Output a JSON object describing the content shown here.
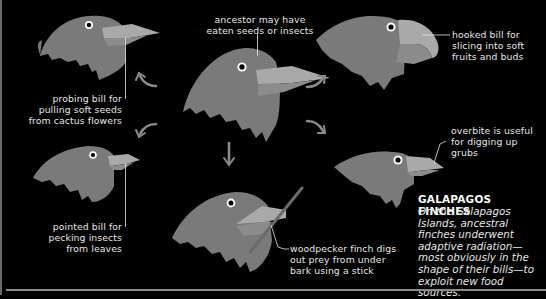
{
  "colors": {
    "background": "#000000",
    "bird_body": "#7a7a7a",
    "bird_head_shade": "#8a8a8a",
    "beak_upper": "#a9a9a9",
    "beak_lower": "#8c8c8c",
    "arrow": "#8a8a8a",
    "text": "#e6e6e6",
    "rule": "#8c8c8c"
  },
  "finches": [
    {
      "id": "ancestor",
      "caption": [
        "ancestor may have",
        "eaten seeds or insects"
      ]
    },
    {
      "id": "probing",
      "caption": [
        "probing bill for",
        "pulling soft seeds",
        "from cactus flowers"
      ]
    },
    {
      "id": "hooked",
      "caption": [
        "hooked bill for",
        "slicing into soft",
        "fruits and buds"
      ]
    },
    {
      "id": "pointed",
      "caption": [
        "pointed bill for",
        "pecking insects",
        "from leaves"
      ]
    },
    {
      "id": "woodpecker",
      "caption": [
        "woodpecker finch digs",
        "out prey from under",
        "bark using a stick"
      ]
    },
    {
      "id": "overbite",
      "caption": [
        "overbite is useful",
        "for digging up grubs"
      ]
    }
  ],
  "sidebar": {
    "title": "GALAPAGOS FINCHES",
    "body": "On the Galapagos Islands, ancestral finches underwent adaptive radiation—most obviously in the shape of their bills—to exploit new food sources."
  },
  "arrows": [
    "up-left",
    "up-right",
    "down-left",
    "down",
    "down-right"
  ]
}
